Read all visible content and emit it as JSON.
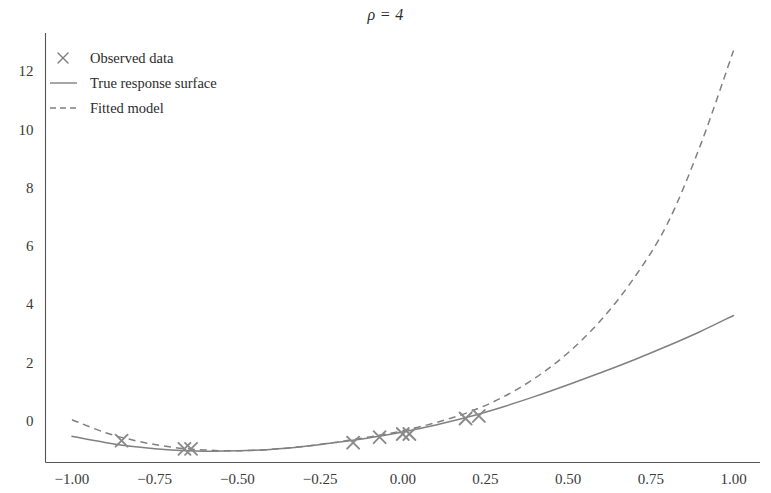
{
  "chart_data": {
    "type": "line",
    "title": "ρ = 4",
    "xlabel": "",
    "ylabel": "",
    "xlim": [
      -1.08,
      1.08
    ],
    "ylim": [
      -1.45,
      13.3
    ],
    "grid": false,
    "legend_position": "upper left",
    "xticks": [
      -1.0,
      -0.75,
      -0.5,
      -0.25,
      0.0,
      0.25,
      0.5,
      0.75,
      1.0
    ],
    "xtick_labels": [
      "−1.00",
      "−0.75",
      "−0.50",
      "−0.25",
      "0.00",
      "0.25",
      "0.50",
      "0.75",
      "1.00"
    ],
    "yticks": [
      0,
      2,
      4,
      6,
      8,
      10,
      12
    ],
    "ytick_labels": [
      "0",
      "2",
      "4",
      "6",
      "8",
      "10",
      "12"
    ],
    "series": [
      {
        "name": "Observed data",
        "type": "scatter",
        "marker": "x",
        "color": "#8a8a8a",
        "x": [
          -0.85,
          -0.66,
          -0.64,
          -0.15,
          -0.07,
          0.0,
          0.02,
          0.19,
          0.23
        ],
        "y": [
          -0.7,
          -0.98,
          -0.98,
          -0.77,
          -0.58,
          -0.47,
          -0.47,
          0.06,
          0.15
        ]
      },
      {
        "name": "True response surface",
        "type": "line",
        "style": "solid",
        "color": "#808080",
        "x": [
          -1.0,
          -0.9,
          -0.8,
          -0.7,
          -0.6,
          -0.5,
          -0.4,
          -0.3,
          -0.2,
          -0.1,
          0.0,
          0.1,
          0.2,
          0.3,
          0.4,
          0.5,
          0.6,
          0.7,
          0.8,
          0.9,
          1.0
        ],
        "y": [
          -0.55,
          -0.76,
          -0.92,
          -1.02,
          -1.06,
          -1.05,
          -1.0,
          -0.9,
          -0.76,
          -0.6,
          -0.4,
          -0.16,
          0.12,
          0.45,
          0.82,
          1.22,
          1.64,
          2.08,
          2.55,
          3.05,
          3.6
        ]
      },
      {
        "name": "Fitted model",
        "type": "line",
        "style": "dashed",
        "color": "#808080",
        "x": [
          -1.0,
          -0.9,
          -0.8,
          -0.7,
          -0.6,
          -0.5,
          -0.4,
          -0.3,
          -0.2,
          -0.1,
          0.0,
          0.1,
          0.2,
          0.3,
          0.4,
          0.5,
          0.6,
          0.7,
          0.8,
          0.9,
          1.0
        ],
        "y": [
          0.02,
          -0.42,
          -0.72,
          -0.92,
          -1.02,
          -1.05,
          -1.0,
          -0.9,
          -0.75,
          -0.57,
          -0.36,
          -0.08,
          0.28,
          0.78,
          1.45,
          2.32,
          3.45,
          4.9,
          6.75,
          9.45,
          12.7
        ]
      }
    ]
  },
  "legend": {
    "items": [
      {
        "label": "Observed data",
        "icon": "marker-x-icon"
      },
      {
        "label": "True response surface",
        "icon": "solid-line-icon"
      },
      {
        "label": "Fitted model",
        "icon": "dashed-line-icon"
      }
    ]
  },
  "colors": {
    "line": "#808080",
    "marker": "#8a8a8a",
    "axis": "#555555",
    "text": "#3a3a3a"
  }
}
